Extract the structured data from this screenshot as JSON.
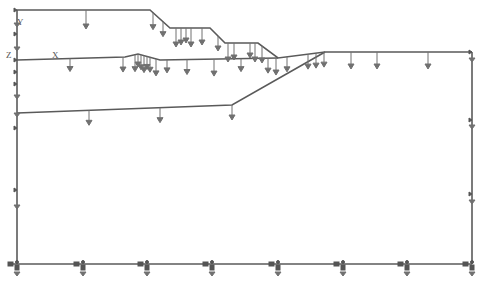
{
  "diagram": {
    "type": "finite-element boundary / load model",
    "axis_labels": {
      "y": "Y",
      "z": "Z",
      "x": "X"
    },
    "caption": "",
    "colors": {
      "line": "#5a5a5a",
      "arrow": "#6a6a6a",
      "background": "#ffffff"
    },
    "layers": [
      {
        "name": "top-surface",
        "points": [
          [
            17,
            10
          ],
          [
            150,
            10
          ],
          [
            170,
            28
          ],
          [
            210,
            28
          ],
          [
            225,
            43
          ],
          [
            258,
            43
          ],
          [
            278,
            58
          ],
          [
            325,
            52
          ],
          [
            472,
            52
          ]
        ]
      },
      {
        "name": "middle-surface",
        "points": [
          [
            17,
            60
          ],
          [
            125,
            57
          ],
          [
            138,
            54
          ],
          [
            160,
            60
          ],
          [
            278,
            58
          ]
        ]
      },
      {
        "name": "lower-surface",
        "points": [
          [
            17,
            113
          ],
          [
            232,
            105
          ],
          [
            325,
            52
          ]
        ]
      }
    ],
    "boundary": {
      "left_x": 17,
      "right_x": 472,
      "bottom_y": 264
    },
    "load_arrows_top": [
      86,
      153,
      163,
      176,
      181,
      186,
      191,
      202,
      218,
      228,
      234,
      250,
      255,
      262
    ],
    "load_arrows_mid": [
      70,
      123,
      135,
      138,
      141,
      144,
      147,
      150,
      156,
      167,
      187,
      214,
      241,
      268,
      276,
      287,
      308,
      316,
      324,
      351,
      377,
      428
    ],
    "load_arrows_low": [
      89,
      160,
      232
    ],
    "supports_bottom": [
      17,
      83,
      147,
      212,
      278,
      343,
      407,
      472
    ]
  }
}
